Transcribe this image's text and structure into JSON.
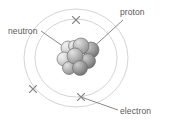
{
  "figure": {
    "width": 169,
    "height": 129,
    "background_color": "#ffffff"
  },
  "labels": {
    "neutron": "neutron",
    "proton": "proton",
    "electron": "electron"
  },
  "colors": {
    "label_text": "#585858",
    "leader_line": "#6b6b6b",
    "orbit_line": "#cfcfcf",
    "electron_marker": "#8a8a8a",
    "nucleus_light": "#d8d8d8",
    "nucleus_mid": "#a8a8a8",
    "nucleus_dark": "#7a7a7a",
    "nucleus_outline": "#6e6e6e"
  },
  "diagram": {
    "type": "bohr-atom-model",
    "nucleus": {
      "center_x": 76,
      "center_y": 58,
      "particles": [
        {
          "id": "p1",
          "cx": 68,
          "cy": 48,
          "r": 7.0,
          "shade": "light"
        },
        {
          "id": "p2",
          "cx": 81,
          "cy": 46,
          "r": 8.0,
          "shade": "mid"
        },
        {
          "id": "p3",
          "cx": 91,
          "cy": 50,
          "r": 8.0,
          "shade": "dark"
        },
        {
          "id": "p4",
          "cx": 64,
          "cy": 59,
          "r": 7.0,
          "shade": "light"
        },
        {
          "id": "p5",
          "cx": 75,
          "cy": 56,
          "r": 8.0,
          "shade": "mid"
        },
        {
          "id": "p6",
          "cx": 88,
          "cy": 61,
          "r": 7.5,
          "shade": "dark"
        },
        {
          "id": "p7",
          "cx": 69,
          "cy": 68,
          "r": 6.5,
          "shade": "mid"
        },
        {
          "id": "p8",
          "cx": 80,
          "cy": 68,
          "r": 7.5,
          "shade": "dark"
        },
        {
          "id": "p9",
          "cx": 74,
          "cy": 46,
          "r": 5.5,
          "shade": "light"
        }
      ]
    },
    "orbits": [
      {
        "id": "inner-orbit",
        "cx": 76,
        "cy": 58,
        "rx": 41,
        "ry": 39
      },
      {
        "id": "outer-orbit",
        "cx": 76,
        "cy": 58,
        "rx": 52,
        "ry": 49
      }
    ],
    "electrons": [
      {
        "id": "electron-top",
        "x": 76,
        "y": 20,
        "orbit": "inner-orbit"
      },
      {
        "id": "electron-lower-left",
        "x": 33,
        "y": 89,
        "orbit": "outer-orbit"
      },
      {
        "id": "electron-bottom",
        "x": 81,
        "y": 97,
        "orbit": "inner-orbit"
      }
    ],
    "leaders": [
      {
        "id": "neutron-leader",
        "x1": 41,
        "y1": 31,
        "x2": 70,
        "y2": 51
      },
      {
        "id": "proton-leader",
        "x1": 123,
        "y1": 20,
        "x2": 88,
        "y2": 52
      },
      {
        "id": "electron-leader",
        "x1": 118,
        "y1": 110,
        "x2": 81,
        "y2": 97
      }
    ]
  }
}
